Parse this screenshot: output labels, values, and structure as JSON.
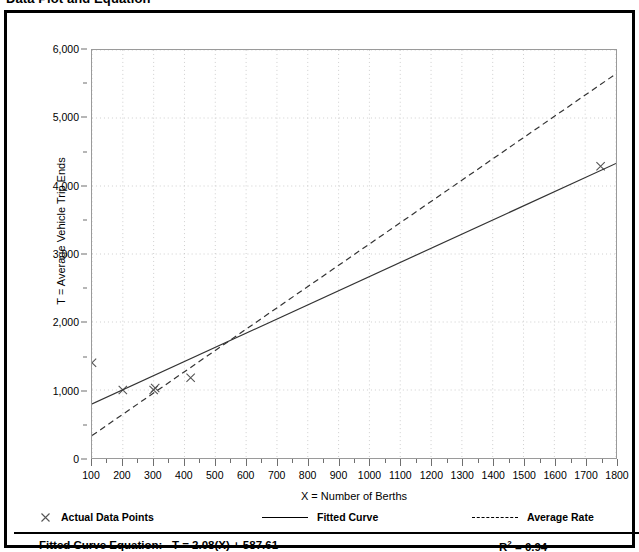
{
  "title": "Data Plot and Equation",
  "chart_data": {
    "type": "scatter",
    "title": "Data Plot and Equation",
    "xlabel": "X = Number of Berths",
    "ylabel": "T = Average Vehicle Trip Ends",
    "xlim": [
      100,
      1800
    ],
    "ylim": [
      0,
      6000
    ],
    "xticks": [
      100,
      200,
      300,
      400,
      500,
      600,
      700,
      800,
      900,
      1000,
      1100,
      1200,
      1300,
      1400,
      1500,
      1600,
      1700,
      1800
    ],
    "yticks": [
      0,
      1000,
      2000,
      3000,
      4000,
      5000,
      6000
    ],
    "ytick_labels": [
      "0",
      "1,000",
      "2,000",
      "3,000",
      "4,000",
      "5,000",
      "6,000"
    ],
    "xtick_labels": [
      "100",
      "200",
      "300",
      "400",
      "500",
      "600",
      "700",
      "800",
      "900",
      "1000",
      "1100",
      "1200",
      "1300",
      "1400",
      "1500",
      "1600",
      "1700",
      "1800"
    ],
    "grid": true,
    "grid_style": "dotted",
    "legend_position": "bottom",
    "series": [
      {
        "name": "Actual Data Points",
        "type": "scatter",
        "marker": "x",
        "color": "#555555",
        "points": [
          {
            "x": 100,
            "y": 1400
          },
          {
            "x": 200,
            "y": 1000
          },
          {
            "x": 300,
            "y": 1000
          },
          {
            "x": 305,
            "y": 1030
          },
          {
            "x": 420,
            "y": 1180
          },
          {
            "x": 1750,
            "y": 4290
          }
        ]
      },
      {
        "name": "Fitted Curve",
        "type": "line",
        "style": "solid",
        "color": "#333333",
        "slope": 2.08,
        "intercept": 587.61,
        "endpoints": [
          {
            "x": 100,
            "y": 796
          },
          {
            "x": 1800,
            "y": 4332
          }
        ]
      },
      {
        "name": "Average Rate",
        "type": "line",
        "style": "dashed",
        "color": "#333333",
        "slope": 3.13,
        "intercept": 17,
        "endpoints": [
          {
            "x": 100,
            "y": 330
          },
          {
            "x": 1800,
            "y": 5650
          }
        ]
      }
    ]
  },
  "axes": {
    "y_title": "T = Average Vehicle Trip Ends",
    "x_title": "X = Number of Berths"
  },
  "legend": {
    "points_label": "Actual Data Points",
    "fitted_label": "Fitted Curve",
    "average_label": "Average Rate"
  },
  "equation": {
    "label": "Fitted Curve Equation:",
    "formula": "T = 2.08(X) + 587.61",
    "r_squared_symbol": "R",
    "r_squared_exponent": "2",
    "r_squared_value": "= 0.94"
  }
}
